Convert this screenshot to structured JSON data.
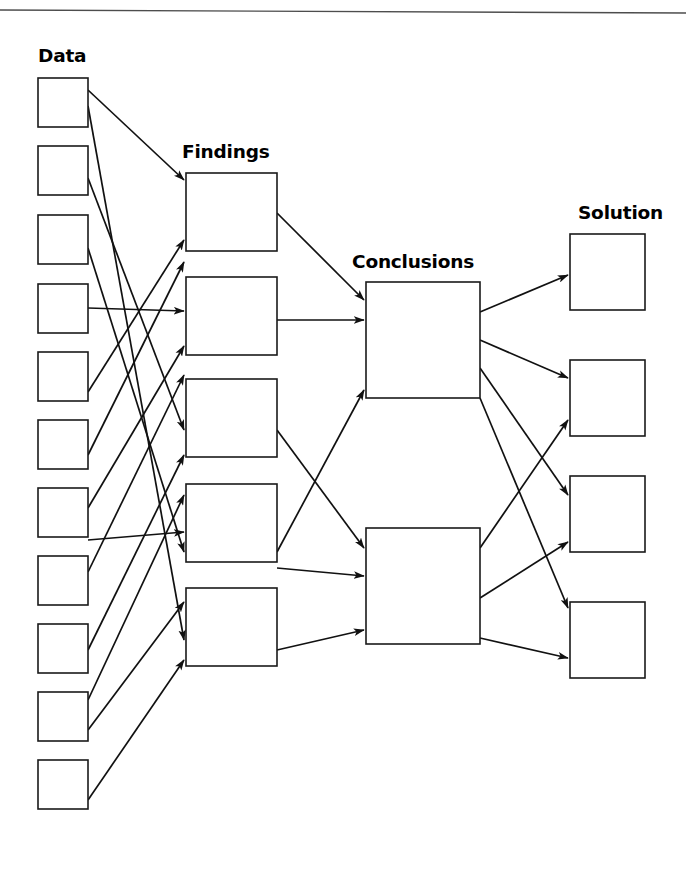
{
  "page": {
    "background_color": "#ffffff",
    "width": 686,
    "height": 896,
    "rule": {
      "name": "top-rule",
      "x1": 0,
      "y1": 10,
      "x2": 686,
      "y2": 13,
      "color": "#4d4d4d"
    }
  },
  "chart_data": {
    "type": "diagram",
    "layout": "left-to-right layered network",
    "stroke_color": "#111111",
    "box_fill": "#ffffff",
    "box_stroke": "#1a1a1a",
    "columns": [
      {
        "id": "data",
        "label": "Data",
        "label_x": 38,
        "label_y": 62,
        "count": 11,
        "box_w": 50,
        "box_h": 49,
        "x": 38,
        "ys": [
          78,
          146,
          215,
          284,
          352,
          420,
          488,
          556,
          624,
          692,
          760
        ],
        "nodes": [
          {
            "id": "D1",
            "label": ""
          },
          {
            "id": "D2",
            "label": ""
          },
          {
            "id": "D3",
            "label": ""
          },
          {
            "id": "D4",
            "label": ""
          },
          {
            "id": "D5",
            "label": ""
          },
          {
            "id": "D6",
            "label": ""
          },
          {
            "id": "D7",
            "label": ""
          },
          {
            "id": "D8",
            "label": ""
          },
          {
            "id": "D9",
            "label": ""
          },
          {
            "id": "D10",
            "label": ""
          },
          {
            "id": "D11",
            "label": ""
          }
        ]
      },
      {
        "id": "findings",
        "label": "Findings",
        "label_x": 182,
        "label_y": 158,
        "count": 5,
        "box_w": 91,
        "box_h": 78,
        "x": 186,
        "ys": [
          173,
          277,
          379,
          484,
          588
        ],
        "nodes": [
          {
            "id": "F1",
            "label": ""
          },
          {
            "id": "F2",
            "label": ""
          },
          {
            "id": "F3",
            "label": ""
          },
          {
            "id": "F4",
            "label": ""
          },
          {
            "id": "F5",
            "label": ""
          }
        ]
      },
      {
        "id": "conclusions",
        "label": "Conclusions",
        "label_x": 352,
        "label_y": 268,
        "count": 2,
        "box_w": 114,
        "box_h": 116,
        "x": 366,
        "ys": [
          282,
          528
        ],
        "nodes": [
          {
            "id": "C1",
            "label": ""
          },
          {
            "id": "C2",
            "label": ""
          }
        ]
      },
      {
        "id": "solution",
        "label": "Solution",
        "label_x": 578,
        "label_y": 219,
        "count": 4,
        "box_w": 75,
        "box_h": 76,
        "x": 570,
        "ys": [
          234,
          360,
          476,
          602
        ],
        "nodes": [
          {
            "id": "S1",
            "label": ""
          },
          {
            "id": "S2",
            "label": ""
          },
          {
            "id": "S3",
            "label": ""
          },
          {
            "id": "S4",
            "label": ""
          }
        ]
      }
    ],
    "edges": [
      {
        "from": "D1",
        "to": "F1",
        "x1": 88,
        "y1": 90,
        "x2": 184,
        "y2": 180
      },
      {
        "from": "D1",
        "to": "F5",
        "x1": 88,
        "y1": 106,
        "x2": 184,
        "y2": 640
      },
      {
        "from": "D2",
        "to": "F3",
        "x1": 88,
        "y1": 178,
        "x2": 184,
        "y2": 430
      },
      {
        "from": "D3",
        "to": "F4",
        "x1": 88,
        "y1": 248,
        "x2": 184,
        "y2": 552
      },
      {
        "from": "D4",
        "to": "F2",
        "x1": 88,
        "y1": 308,
        "x2": 184,
        "y2": 311
      },
      {
        "from": "D5",
        "to": "F1",
        "x1": 88,
        "y1": 392,
        "x2": 184,
        "y2": 240
      },
      {
        "from": "D6",
        "to": "F1",
        "x1": 88,
        "y1": 455,
        "x2": 184,
        "y2": 262
      },
      {
        "from": "D7",
        "to": "F2",
        "x1": 88,
        "y1": 508,
        "x2": 184,
        "y2": 346
      },
      {
        "from": "D7",
        "to": "F4",
        "x1": 88,
        "y1": 540,
        "x2": 184,
        "y2": 532
      },
      {
        "from": "D8",
        "to": "F2",
        "x1": 88,
        "y1": 572,
        "x2": 184,
        "y2": 375
      },
      {
        "from": "D9",
        "to": "F3",
        "x1": 88,
        "y1": 650,
        "x2": 184,
        "y2": 455
      },
      {
        "from": "D10",
        "to": "F4",
        "x1": 88,
        "y1": 700,
        "x2": 184,
        "y2": 495
      },
      {
        "from": "D10",
        "to": "F5",
        "x1": 88,
        "y1": 730,
        "x2": 184,
        "y2": 602
      },
      {
        "from": "D11",
        "to": "F5",
        "x1": 88,
        "y1": 800,
        "x2": 184,
        "y2": 660
      },
      {
        "from": "F1",
        "to": "C1",
        "x1": 277,
        "y1": 213,
        "x2": 364,
        "y2": 300
      },
      {
        "from": "F2",
        "to": "C1",
        "x1": 277,
        "y1": 320,
        "x2": 364,
        "y2": 320
      },
      {
        "from": "F3",
        "to": "C2",
        "x1": 277,
        "y1": 430,
        "x2": 364,
        "y2": 548
      },
      {
        "from": "F4",
        "to": "C1",
        "x1": 277,
        "y1": 552,
        "x2": 364,
        "y2": 390
      },
      {
        "from": "F4",
        "to": "C2",
        "x1": 277,
        "y1": 568,
        "x2": 364,
        "y2": 576
      },
      {
        "from": "F5",
        "to": "C2",
        "x1": 277,
        "y1": 650,
        "x2": 364,
        "y2": 630
      },
      {
        "from": "C1",
        "to": "S1",
        "x1": 480,
        "y1": 312,
        "x2": 568,
        "y2": 275
      },
      {
        "from": "C1",
        "to": "S2",
        "x1": 480,
        "y1": 340,
        "x2": 568,
        "y2": 378
      },
      {
        "from": "C1",
        "to": "S3",
        "x1": 480,
        "y1": 368,
        "x2": 568,
        "y2": 495
      },
      {
        "from": "C1",
        "to": "S4",
        "x1": 480,
        "y1": 398,
        "x2": 568,
        "y2": 608
      },
      {
        "from": "C2",
        "to": "S2",
        "x1": 480,
        "y1": 548,
        "x2": 568,
        "y2": 420
      },
      {
        "from": "C2",
        "to": "S3",
        "x1": 480,
        "y1": 598,
        "x2": 568,
        "y2": 542
      },
      {
        "from": "C2",
        "to": "S4",
        "x1": 480,
        "y1": 638,
        "x2": 568,
        "y2": 658
      }
    ]
  }
}
